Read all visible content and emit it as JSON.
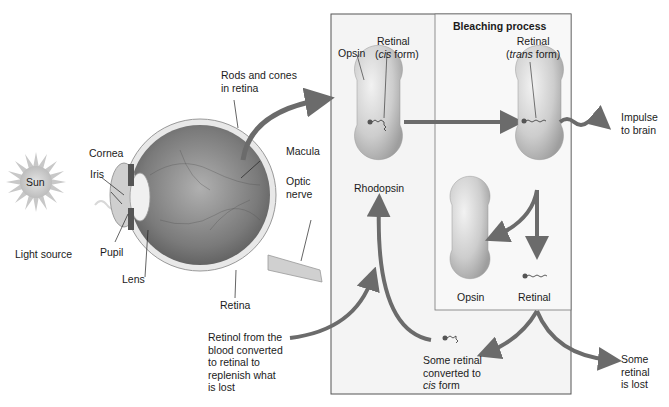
{
  "colors": {
    "arrow": "#6b6b6b",
    "box_border": "#555555",
    "box_fill": "#f4f4f4",
    "inner_box_fill": "#f8f8f8",
    "molecule": "#cfcfcf"
  },
  "light": {
    "sun_label": "Sun",
    "source_label": "Light source"
  },
  "eye_labels": {
    "cornea": "Cornea",
    "iris": "Iris",
    "pupil": "Pupil",
    "lens": "Lens",
    "rods_cones_line1": "Rods and cones",
    "rods_cones_line2": "in retina",
    "macula": "Macula",
    "optic_line1": "Optic",
    "optic_line2": "nerve",
    "retina": "Retina"
  },
  "rhodopsin_panel": {
    "opsin_label": "Opsin",
    "retinal_label": "Retinal",
    "cis_open": "(",
    "cis_word": "cis",
    "cis_rest": " form)",
    "molecule_label": "Rhodopsin"
  },
  "bleaching_panel": {
    "title": "Bleaching process",
    "retinal_label": "Retinal",
    "trans_open": "(",
    "trans_word": "trans",
    "trans_rest": " form)",
    "opsin_label": "Opsin",
    "free_retinal_label": "Retinal"
  },
  "outcomes": {
    "impulse_line1": "Impulse",
    "impulse_line2": "to brain",
    "cis_conv_line1": "Some retinal",
    "cis_conv_line2": "converted to",
    "cis_conv_word": "cis",
    "cis_conv_rest": " form",
    "lost_line1": "Some",
    "lost_line2": "retinal",
    "lost_line3": "is lost",
    "retinol_line1": "Retinol from the",
    "retinol_line2": "blood converted",
    "retinol_line3": "to retinal to",
    "retinol_line4": "replenish what",
    "retinol_line5": "is lost"
  }
}
